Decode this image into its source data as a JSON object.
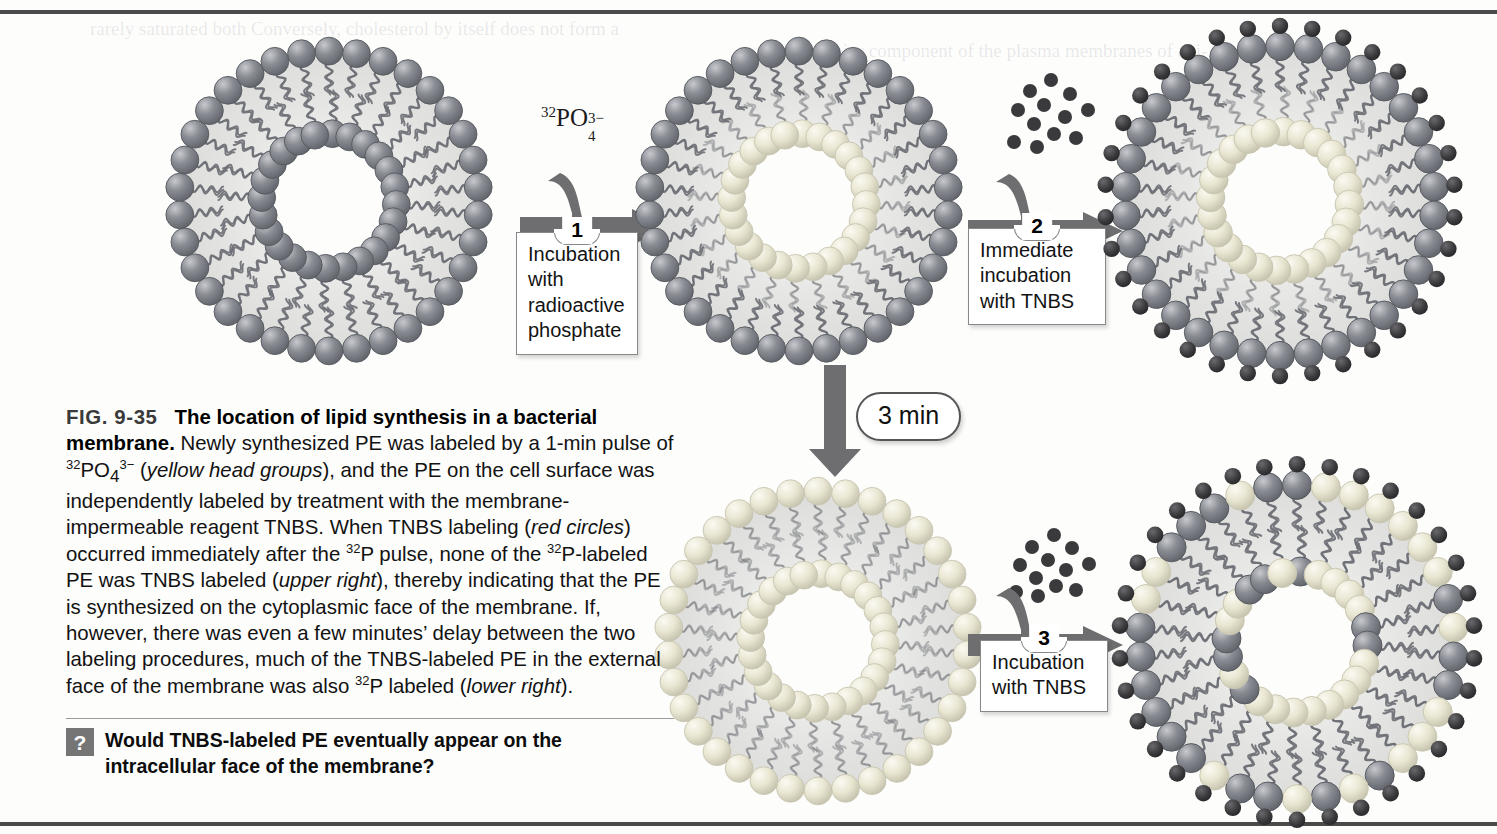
{
  "figure": {
    "number": "FIG. 9-35",
    "title": "The location of lipid synthesis in a bacterial membrane.",
    "caption_html": "Newly synthesized PE was labeled by a 1-min pulse of <sup>32</sup>PO<sub>4</sub><sup>3&#8722;</sup> (<i>yellow head groups</i>), and the PE on the cell surface was independently labeled by treatment with the membrane-impermeable reagent TNBS. When TNBS labeling (<i>red circles</i>) occurred immediately after the <sup>32</sup>P pulse, none of the <sup>32</sup>P-labeled PE was TNBS labeled (<i>upper right</i>), thereby indicating that the PE is synthesized on the cytoplasmic face of the membrane. If, however, there was even a few minutes&#8217; delay between the two labeling procedures, much of the TNBS-labeled PE in the external face of the membrane was also <sup>32</sup>P labeled (<i>lower right</i>)."
  },
  "question": {
    "icon": "question-mark-icon",
    "text": "Would TNBS-labeled PE eventually appear on the intracellular face of the membrane?"
  },
  "reagents": {
    "phosphate_label_html": "<sup>32</sup>PO<sub>4</sub><sup>3&#8722;</sup>",
    "phosphate_label_text": "32PO4 3-"
  },
  "steps": [
    {
      "number": "1",
      "text": "Incubation with radioactive phosphate"
    },
    {
      "number": "2",
      "text": "Immediate incubation with TNBS"
    },
    {
      "number": "3",
      "text": "Incubation with TNBS"
    }
  ],
  "delay": {
    "label": "3 min"
  },
  "colors": {
    "head_unlabeled": "#8a8c93",
    "head_labeled_32p": "#e9e6d2",
    "tnbs_dot": "#3a3a3c",
    "tail": "#6e7076",
    "bilayer_fill": "#e3e3e1",
    "arrow": "#6e6e70",
    "rule": "#4a4a4a"
  },
  "legend": {
    "yellow_head_groups": "32P-labeled PE head group",
    "red_circles": "TNBS label",
    "gray_head_groups": "unlabeled PE head group"
  },
  "vesicles": [
    {
      "id": "v1",
      "name": "unlabeled-vesicle",
      "outer": "unlabeled",
      "inner": "unlabeled",
      "tnbs": false
    },
    {
      "id": "v2",
      "name": "p32-inner-labeled-vesicle",
      "outer": "unlabeled",
      "inner": "labeled",
      "tnbs": false
    },
    {
      "id": "v3",
      "name": "tnbs-outer-labeled-vesicle",
      "outer": "unlabeled",
      "inner": "labeled",
      "tnbs": true
    },
    {
      "id": "v4",
      "name": "p32-redistributed-vesicle",
      "outer": "labeled",
      "inner": "labeled",
      "tnbs": false
    },
    {
      "id": "v5",
      "name": "double-labeled-vesicle",
      "outer": "mixed",
      "inner": "mixed",
      "tnbs": true
    }
  ],
  "bleed_text": [
    "rarely saturated both  Conversely, cholesterol by itself does not form a",
    "but is a major component of the plasma membranes of ani-"
  ]
}
